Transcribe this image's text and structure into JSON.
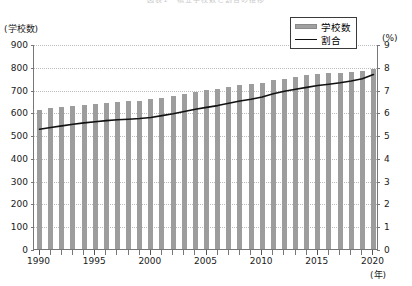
{
  "chart_data": {
    "type": "bar",
    "title": "図表1　私立学校数と割合の推移",
    "xlabel": "(年)",
    "ylabel": "(学校数)",
    "y2label": "(%)",
    "ylim": [
      0,
      900
    ],
    "y2lim": [
      0,
      9
    ],
    "ytick_step": 100,
    "y2tick_step": 1,
    "grid": true,
    "legend_position": "top-right",
    "yticks_left": [
      "0",
      "100",
      "200",
      "300",
      "400",
      "500",
      "600",
      "700",
      "800",
      "900"
    ],
    "yticks_right": [
      "0",
      "1",
      "2",
      "3",
      "4",
      "5",
      "6",
      "7",
      "8",
      "9"
    ],
    "xticks_labeled": [
      "1990",
      "1995",
      "2000",
      "2005",
      "2010",
      "2015",
      "2020"
    ],
    "categories": [
      "1990",
      "1991",
      "1992",
      "1993",
      "1994",
      "1995",
      "1996",
      "1997",
      "1998",
      "1999",
      "2000",
      "2001",
      "2002",
      "2003",
      "2004",
      "2005",
      "2006",
      "2007",
      "2008",
      "2009",
      "2010",
      "2011",
      "2012",
      "2013",
      "2014",
      "2015",
      "2016",
      "2017",
      "2018",
      "2019",
      "2020"
    ],
    "series": [
      {
        "name": "学校数",
        "type": "bar",
        "axis": "left",
        "color": "#9d9d9d",
        "values": [
          612,
          618,
          622,
          628,
          634,
          636,
          640,
          646,
          650,
          652,
          658,
          664,
          672,
          680,
          688,
          696,
          702,
          710,
          718,
          724,
          730,
          740,
          748,
          756,
          764,
          770,
          772,
          774,
          778,
          782,
          790
        ]
      },
      {
        "name": "割合",
        "type": "line",
        "axis": "right",
        "color": "#111111",
        "values": [
          5.3,
          5.38,
          5.45,
          5.52,
          5.58,
          5.63,
          5.68,
          5.72,
          5.74,
          5.77,
          5.82,
          5.9,
          5.98,
          6.08,
          6.18,
          6.26,
          6.34,
          6.44,
          6.54,
          6.62,
          6.72,
          6.86,
          6.97,
          7.06,
          7.14,
          7.22,
          7.28,
          7.34,
          7.42,
          7.52,
          7.7
        ]
      }
    ]
  },
  "legend": {
    "items": [
      {
        "label": "学校数",
        "marker": "bar-swatch"
      },
      {
        "label": "割合",
        "marker": "line-swatch"
      }
    ]
  },
  "colors": {
    "bar": "#9d9d9d",
    "line": "#111111",
    "grid": "#bdbdbd",
    "axis": "#777777",
    "text": "#1a1a1a"
  }
}
